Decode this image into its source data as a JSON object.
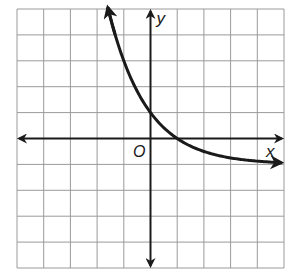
{
  "chart_data": {
    "type": "line",
    "title": "",
    "xlabel": "x",
    "ylabel": "y",
    "origin_label": "O",
    "xlim": [
      -5,
      5
    ],
    "ylim": [
      -5,
      5
    ],
    "grid": true,
    "grid_step": 1,
    "tick_labels": false,
    "legend": null,
    "function": "y = 2(1/2)^x - 1",
    "asymptote": {
      "type": "horizontal",
      "y": -1
    },
    "key_points": [
      {
        "x": -1,
        "y": 3
      },
      {
        "x": 0,
        "y": 1
      },
      {
        "x": 1,
        "y": 0
      },
      {
        "x": 2,
        "y": -0.5
      },
      {
        "x": 3,
        "y": -0.75
      },
      {
        "x": 4,
        "y": -0.875
      }
    ],
    "series": [
      {
        "name": "curve",
        "x": [
          -1.6,
          -1.5,
          -1.25,
          -1,
          -0.75,
          -0.5,
          -0.25,
          0,
          0.25,
          0.5,
          0.75,
          1,
          1.5,
          2,
          2.5,
          3,
          3.5,
          4,
          4.5,
          4.9
        ],
        "values": [
          5.06,
          4.66,
          3.76,
          3.0,
          2.36,
          1.83,
          1.38,
          1.0,
          0.68,
          0.41,
          0.19,
          0.0,
          -0.29,
          -0.5,
          -0.65,
          -0.75,
          -0.82,
          -0.875,
          -0.91,
          -0.93
        ],
        "color": "#1a1a1a",
        "arrows": "both-ends"
      }
    ],
    "axes_arrows": true
  },
  "colors": {
    "grid": "#9a9a9a",
    "axis": "#1a1a1a",
    "curve": "#1a1a1a",
    "background": "#ffffff"
  }
}
